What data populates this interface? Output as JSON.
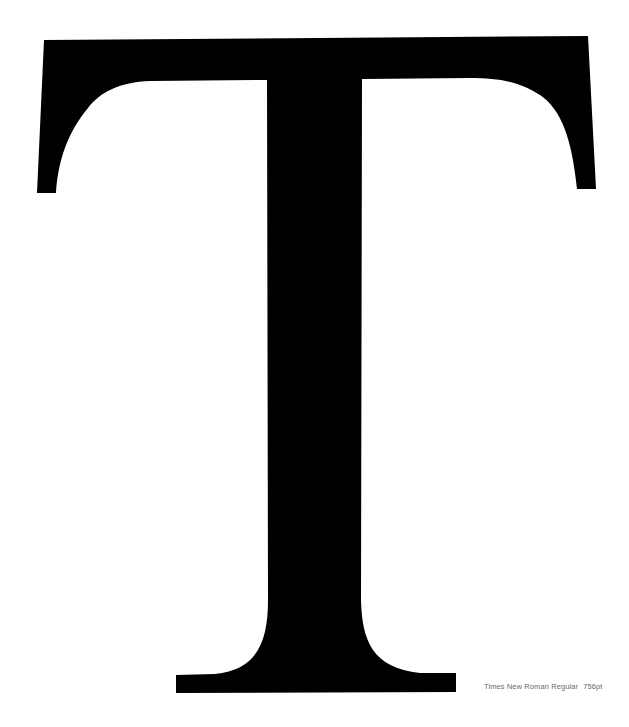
{
  "specimen": {
    "letter": "T",
    "glyph_color": "#000000",
    "background_color": "#ffffff"
  },
  "caption": {
    "font_name": "Times New Roman Regular",
    "point_size": "756pt",
    "color": "#6a6a6a"
  }
}
